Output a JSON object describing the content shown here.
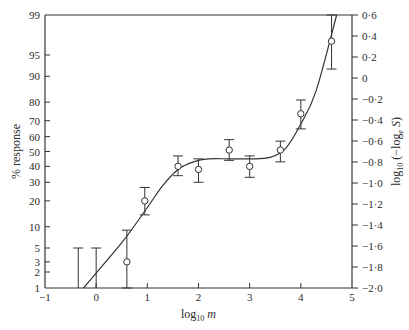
{
  "chart_data": {
    "type": "scatter",
    "title": "",
    "xlabel": "log10 m",
    "ylabel_left": "% response",
    "ylabel_right": "log10 (−loge S)",
    "xlim": [
      -1,
      5
    ],
    "ylim_left_percent": [
      1,
      99
    ],
    "ylim_right": [
      -2.0,
      0.6
    ],
    "y_left_scale": "probit",
    "grid": false,
    "x_ticks": [
      "−1",
      "0",
      "1",
      "2",
      "3",
      "4",
      "5"
    ],
    "y_left_ticks": [
      "1",
      "2",
      "3",
      "5",
      "10",
      "20",
      "30",
      "40",
      "50",
      "60",
      "70",
      "80",
      "90",
      "95",
      "99"
    ],
    "y_right_ticks": [
      "0·6",
      "0·4",
      "0·2",
      "0",
      "−0·2",
      "−0·4",
      "−0·6",
      "−0·8",
      "−1·0",
      "−1·2",
      "−1·4",
      "−1·6",
      "−1·8",
      "−2·0"
    ],
    "points": [
      {
        "x": 0.6,
        "y": 3,
        "err_low": 1,
        "err_high": 9
      },
      {
        "x": 0.95,
        "y": 20,
        "err_low": 14,
        "err_high": 27
      },
      {
        "x": 1.6,
        "y": 40,
        "err_low": 34,
        "err_high": 47
      },
      {
        "x": 2.0,
        "y": 38,
        "err_low": 30,
        "err_high": 45
      },
      {
        "x": 2.6,
        "y": 51,
        "err_low": 44,
        "err_high": 58
      },
      {
        "x": 3.0,
        "y": 40,
        "err_low": 33,
        "err_high": 47
      },
      {
        "x": 3.6,
        "y": 51,
        "err_low": 43,
        "err_high": 57
      },
      {
        "x": 4.0,
        "y": 74,
        "err_low": 65,
        "err_high": 81
      },
      {
        "x": 4.6,
        "y": 97,
        "err_low": 92,
        "err_high": 99
      }
    ],
    "upper_limit_bars": [
      {
        "x": -0.35,
        "low": 1,
        "high": 5
      },
      {
        "x": 0.0,
        "low": 1,
        "high": 5
      }
    ],
    "fitted_curve": {
      "description": "Rising line from ~1% at x≈-0.25 through plateau ~45% between x≈2 and x≈3.5, then rising to 99% at x≈4.7",
      "x": [
        -0.25,
        0.5,
        1.0,
        1.3,
        1.6,
        1.9,
        2.2,
        2.6,
        3.0,
        3.4,
        3.7,
        4.0,
        4.3,
        4.7
      ],
      "y": [
        1,
        6,
        17,
        28,
        38,
        43,
        45,
        45,
        45,
        46,
        52,
        68,
        85,
        99
      ]
    }
  }
}
